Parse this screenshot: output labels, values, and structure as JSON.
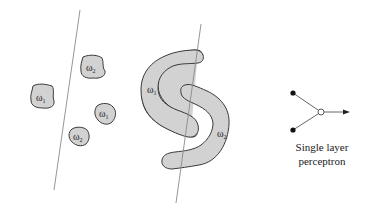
{
  "left_panel": {
    "blobs": [
      {
        "class": "ω",
        "sub": "1"
      },
      {
        "class": "ω",
        "sub": "2"
      },
      {
        "class": "ω",
        "sub": "1"
      },
      {
        "class": "ω",
        "sub": "2"
      }
    ]
  },
  "middle_panel": {
    "s_shapes": [
      {
        "class": "ω",
        "sub": "1"
      },
      {
        "class": "ω",
        "sub": "2"
      }
    ]
  },
  "perceptron": {
    "caption_line1": "Single layer",
    "caption_line2": "perceptron"
  },
  "colors": {
    "fill": "#d2d2d2",
    "outline": "#3a3a3a",
    "line": "#8a8a8a"
  }
}
